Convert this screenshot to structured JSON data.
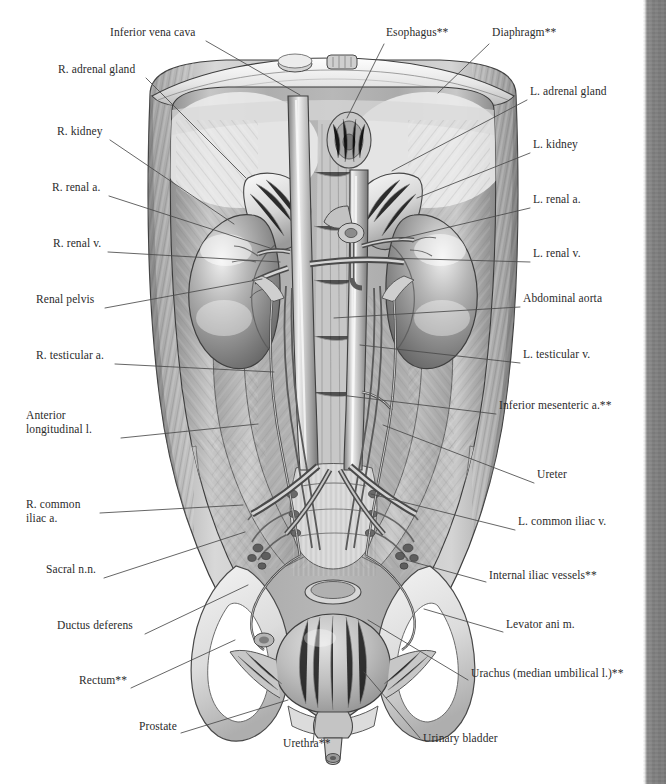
{
  "plate": {
    "title": "Posterior abdominal wall, kidneys and male urinary organs",
    "view": "anterior view",
    "style": "grayscale pencil anatomical illustration",
    "footnote_marker": "**"
  },
  "colors": {
    "background": "#ffffff",
    "text": "#2b2b2b",
    "leader_line": "#4a4a4a",
    "page_edge": "#808080",
    "art_light": "#f2f2f2",
    "art_mid": "#b9b9b9",
    "art_dark": "#6e6e6e",
    "art_deep": "#4a4a4a"
  },
  "labels_left": [
    {
      "id": "inferior-vena-cava",
      "text": "Inferior vena cava",
      "x": 110,
      "y": 35,
      "lines": [
        "Inferior vena cava"
      ],
      "lx": 206,
      "ly": 41,
      "tx": 300,
      "ty": 95
    },
    {
      "id": "r-adrenal-gland",
      "text": "R. adrenal gland",
      "x": 58,
      "y": 72,
      "lines": [
        "R. adrenal gland"
      ],
      "lx": 146,
      "ly": 78,
      "tx": 246,
      "ty": 178
    },
    {
      "id": "r-kidney",
      "text": "R. kidney",
      "x": 57,
      "y": 134,
      "lines": [
        "R. kidney"
      ],
      "lx": 110,
      "ly": 140,
      "tx": 234,
      "ty": 224
    },
    {
      "id": "r-renal-a",
      "text": "R. renal a.",
      "x": 52,
      "y": 190,
      "lines": [
        "R. renal a."
      ],
      "lx": 109,
      "ly": 196,
      "tx": 270,
      "ty": 248
    },
    {
      "id": "r-renal-v",
      "text": "R. renal v.",
      "x": 53,
      "y": 246,
      "lines": [
        "R. renal v."
      ],
      "lx": 108,
      "ly": 252,
      "tx": 280,
      "ty": 262
    },
    {
      "id": "renal-pelvis",
      "text": "Renal pelvis",
      "x": 36,
      "y": 302,
      "lines": [
        "Renal pelvis"
      ],
      "lx": 105,
      "ly": 308,
      "tx": 262,
      "ty": 279
    },
    {
      "id": "r-testicular-a",
      "text": "R. testicular a.",
      "x": 36,
      "y": 358,
      "lines": [
        "R. testicular a."
      ],
      "lx": 115,
      "ly": 364,
      "tx": 274,
      "ty": 372
    },
    {
      "id": "anterior-longitudinal-l",
      "text": "Anterior longitudinal l.",
      "x": 26,
      "y": 418,
      "lines": [
        "Anterior",
        "longitudinal l."
      ],
      "lx": 121,
      "ly": 438,
      "tx": 258,
      "ty": 424
    },
    {
      "id": "r-common-iliac-a",
      "text": "R. common iliac a.",
      "x": 26,
      "y": 507,
      "lines": [
        "R. common",
        "iliac a."
      ],
      "lx": 100,
      "ly": 513,
      "tx": 243,
      "ty": 505
    },
    {
      "id": "sacral-nn",
      "text": "Sacral n.n.",
      "x": 46,
      "y": 572,
      "lines": [
        "Sacral n.n."
      ],
      "lx": 104,
      "ly": 578,
      "tx": 245,
      "ty": 532
    },
    {
      "id": "ductus-deferens",
      "text": "Ductus deferens",
      "x": 57,
      "y": 628,
      "lines": [
        "Ductus deferens"
      ],
      "lx": 145,
      "ly": 634,
      "tx": 248,
      "ty": 585
    },
    {
      "id": "rectum",
      "text": "Rectum**",
      "x": 79,
      "y": 683,
      "lines": [
        "Rectum**"
      ],
      "lx": 131,
      "ly": 688,
      "tx": 235,
      "ty": 640
    },
    {
      "id": "prostate",
      "text": "Prostate",
      "x": 139,
      "y": 729,
      "lines": [
        "Prostate"
      ],
      "lx": 181,
      "ly": 733,
      "tx": 288,
      "ty": 700
    },
    {
      "id": "urethra",
      "text": "Urethra**",
      "x": 283,
      "y": 746,
      "lines": [
        "Urethra**"
      ],
      "lx": 313,
      "ly": 743,
      "tx": 316,
      "ty": 717
    }
  ],
  "labels_right": [
    {
      "id": "esophagus",
      "text": "Esophagus**",
      "x": 386,
      "y": 35,
      "lines": [
        "Esophagus**"
      ],
      "lx": 384,
      "ly": 44,
      "tx": 347,
      "ty": 118
    },
    {
      "id": "diaphragm",
      "text": "Diaphragm**",
      "x": 492,
      "y": 35,
      "lines": [
        "Diaphragm**"
      ],
      "lx": 489,
      "ly": 44,
      "tx": 438,
      "ty": 93
    },
    {
      "id": "l-adrenal-gland",
      "text": "L. adrenal gland",
      "x": 530,
      "y": 94,
      "lines": [
        "L. adrenal gland"
      ],
      "lx": 527,
      "ly": 100,
      "tx": 392,
      "ty": 171
    },
    {
      "id": "l-kidney",
      "text": "L. kidney",
      "x": 533,
      "y": 147,
      "lines": [
        "L. kidney"
      ],
      "lx": 530,
      "ly": 153,
      "tx": 417,
      "ty": 198
    },
    {
      "id": "l-renal-a",
      "text": "L. renal a.",
      "x": 533,
      "y": 202,
      "lines": [
        "L. renal a."
      ],
      "lx": 530,
      "ly": 208,
      "tx": 399,
      "ty": 239
    },
    {
      "id": "l-renal-v",
      "text": "L. renal v.",
      "x": 533,
      "y": 256,
      "lines": [
        "L. renal v."
      ],
      "lx": 530,
      "ly": 262,
      "tx": 386,
      "ty": 258
    },
    {
      "id": "abdominal-aorta",
      "text": "Abdominal aorta",
      "x": 523,
      "y": 301,
      "lines": [
        "Abdominal aorta"
      ],
      "lx": 520,
      "ly": 307,
      "tx": 334,
      "ty": 318
    },
    {
      "id": "l-testicular-v",
      "text": "L. testicular v.",
      "x": 523,
      "y": 357,
      "lines": [
        "L. testicular v."
      ],
      "lx": 520,
      "ly": 363,
      "tx": 360,
      "ty": 345
    },
    {
      "id": "inferior-mesenteric-a",
      "text": "Inferior mesenteric a.**",
      "x": 499,
      "y": 408,
      "lines": [
        "Inferior mesenteric a.**"
      ],
      "lx": 496,
      "ly": 414,
      "tx": 340,
      "ty": 395
    },
    {
      "id": "ureter",
      "text": "Ureter",
      "x": 537,
      "y": 477,
      "lines": [
        "Ureter"
      ],
      "lx": 534,
      "ly": 483,
      "tx": 383,
      "ty": 425
    },
    {
      "id": "l-common-iliac-v",
      "text": "L. common iliac v.",
      "x": 518,
      "y": 524,
      "lines": [
        "L. common iliac v."
      ],
      "lx": 515,
      "ly": 530,
      "tx": 371,
      "ty": 494
    },
    {
      "id": "internal-iliac-vessels",
      "text": "Internal iliac vessels**",
      "x": 489,
      "y": 578,
      "lines": [
        "Internal iliac vessels**"
      ],
      "lx": 486,
      "ly": 582,
      "tx": 406,
      "ty": 560
    },
    {
      "id": "levator-ani-m",
      "text": "Levator ani m.",
      "x": 506,
      "y": 627,
      "lines": [
        "Levator ani m."
      ],
      "lx": 503,
      "ly": 632,
      "tx": 424,
      "ty": 609
    },
    {
      "id": "urachus",
      "text": "Urachus (median umbilical l.)**",
      "x": 471,
      "y": 676,
      "lines": [
        "Urachus (median umbilical l.)**"
      ],
      "lx": 468,
      "ly": 680,
      "tx": 368,
      "ty": 620
    },
    {
      "id": "urinary-bladder",
      "text": "Urinary bladder",
      "x": 423,
      "y": 741,
      "lines": [
        "Urinary bladder"
      ],
      "lx": 420,
      "ly": 738,
      "tx": 364,
      "ty": 672
    }
  ]
}
